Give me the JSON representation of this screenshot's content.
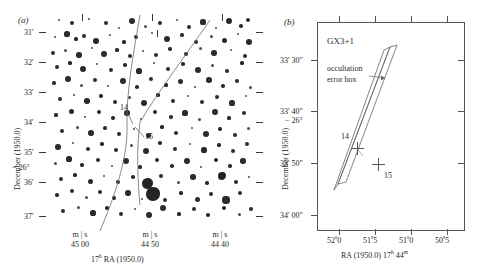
{
  "figure": {
    "kind": "two-panel astronomical finding chart",
    "panels": [
      {
        "letter": "(a)",
        "y_axis_title": "December (1950.0)",
        "y_tick_labels": [
          "31'",
          "32'",
          "33'",
          "34'",
          "35'",
          "36'",
          "37'"
        ],
        "y_degree_label": "− 26°",
        "x_axis_title_parts": {
          "hour": "17",
          "hour_sup": "h",
          "rest": " RA (1950.0)"
        },
        "x_groups": [
          {
            "units": "m | s",
            "value": "45  00"
          },
          {
            "units": "m | s",
            "value": "44  50"
          },
          {
            "units": "m | s",
            "value": "44  40"
          }
        ],
        "star_annotations": [
          {
            "id": "14",
            "label": "14"
          },
          {
            "id": "15",
            "label": "15"
          }
        ]
      },
      {
        "letter": "(b)",
        "title": "GX3+1",
        "annotation": {
          "line1": "occultation",
          "line2": "error box"
        },
        "y_axis_title": "December (1950.0)",
        "y_tick_labels": [
          "33' 30\"",
          "33' 40\"",
          "33' 50\"",
          "34' 00\""
        ],
        "y_degree_label": "− 26°",
        "x_tick_labels": [
          {
            "pre": "52",
            "sup": "s",
            "post": "0"
          },
          {
            "pre": "51",
            "sup": "s",
            "post": "5"
          },
          {
            "pre": "51",
            "sup": "s",
            "post": "0"
          },
          {
            "pre": "50",
            "sup": "s",
            "post": "5"
          }
        ],
        "x_axis_title_parts": {
          "lead": "RA (1950.0) 17",
          "sup1": "h",
          "mid": " 44",
          "sup2": "m"
        },
        "source_markers": [
          {
            "id": "14",
            "label": "14"
          },
          {
            "id": "15",
            "label": "15"
          }
        ]
      }
    ]
  },
  "colors": {
    "ink": "#2b2b2b",
    "frame": "#555555",
    "line": "#6b6b6b",
    "background": "#ffffff"
  },
  "chart_data": {
    "type": "scatter",
    "panel_a": {
      "xlabel": "17h RA (1950.0)",
      "ylabel": "December (1950.0)",
      "xtick_labels": [
        "45 00",
        "44 50",
        "44 40"
      ],
      "ytick_labels": [
        "31'",
        "32'",
        "33'",
        "34'",
        "35'",
        "36'",
        "37'"
      ],
      "grid": false,
      "stars": [
        {
          "x": 11,
          "y": 3,
          "r": 1.1
        },
        {
          "x": 24,
          "y": 6,
          "r": 1.9
        },
        {
          "x": 41,
          "y": 2,
          "r": 1.2
        },
        {
          "x": 58,
          "y": 6,
          "r": 2.1
        },
        {
          "x": 71,
          "y": 11,
          "r": 1.3
        },
        {
          "x": 84,
          "y": 4,
          "r": 2.9
        },
        {
          "x": 97,
          "y": 9,
          "r": 1.5
        },
        {
          "x": 112,
          "y": 6,
          "r": 2.4
        },
        {
          "x": 129,
          "y": 3,
          "r": 1.3
        },
        {
          "x": 141,
          "y": 10,
          "r": 1.9
        },
        {
          "x": 155,
          "y": 5,
          "r": 2.6
        },
        {
          "x": 168,
          "y": 11,
          "r": 1.4
        },
        {
          "x": 181,
          "y": 4,
          "r": 3.2
        },
        {
          "x": 193,
          "y": 9,
          "r": 1.8
        },
        {
          "x": 200,
          "y": 3,
          "r": 2.1
        },
        {
          "x": 7,
          "y": 20,
          "r": 1.4
        },
        {
          "x": 19,
          "y": 17,
          "r": 2.6
        },
        {
          "x": 28,
          "y": 22,
          "r": 1.6
        },
        {
          "x": 36,
          "y": 19,
          "r": 1.9
        },
        {
          "x": 48,
          "y": 24,
          "r": 2.8
        },
        {
          "x": 62,
          "y": 18,
          "r": 1.3
        },
        {
          "x": 76,
          "y": 25,
          "r": 1.6
        },
        {
          "x": 88,
          "y": 20,
          "r": 2.2
        },
        {
          "x": 104,
          "y": 16,
          "r": 1.4
        },
        {
          "x": 119,
          "y": 22,
          "r": 3.0
        },
        {
          "x": 134,
          "y": 18,
          "r": 1.7
        },
        {
          "x": 148,
          "y": 25,
          "r": 2.0
        },
        {
          "x": 163,
          "y": 19,
          "r": 1.5
        },
        {
          "x": 176,
          "y": 23,
          "r": 2.5
        },
        {
          "x": 190,
          "y": 17,
          "r": 1.4
        },
        {
          "x": 201,
          "y": 25,
          "r": 2.9
        },
        {
          "x": 5,
          "y": 36,
          "r": 2.0
        },
        {
          "x": 17,
          "y": 33,
          "r": 1.5
        },
        {
          "x": 31,
          "y": 38,
          "r": 2.7
        },
        {
          "x": 44,
          "y": 31,
          "r": 1.4
        },
        {
          "x": 56,
          "y": 37,
          "r": 3.3
        },
        {
          "x": 69,
          "y": 33,
          "r": 1.6
        },
        {
          "x": 82,
          "y": 39,
          "r": 2.1
        },
        {
          "x": 95,
          "y": 34,
          "r": 1.3
        },
        {
          "x": 108,
          "y": 38,
          "r": 2.4
        },
        {
          "x": 122,
          "y": 32,
          "r": 1.7
        },
        {
          "x": 138,
          "y": 37,
          "r": 2.0
        },
        {
          "x": 152,
          "y": 31,
          "r": 1.5
        },
        {
          "x": 166,
          "y": 36,
          "r": 2.8
        },
        {
          "x": 183,
          "y": 33,
          "r": 1.4
        },
        {
          "x": 197,
          "y": 39,
          "r": 2.2
        },
        {
          "x": 9,
          "y": 50,
          "r": 2.4
        },
        {
          "x": 22,
          "y": 46,
          "r": 1.6
        },
        {
          "x": 35,
          "y": 52,
          "r": 3.1
        },
        {
          "x": 49,
          "y": 47,
          "r": 1.4
        },
        {
          "x": 63,
          "y": 53,
          "r": 2.0
        },
        {
          "x": 77,
          "y": 48,
          "r": 1.7
        },
        {
          "x": 91,
          "y": 54,
          "r": 2.6
        },
        {
          "x": 106,
          "y": 46,
          "r": 1.3
        },
        {
          "x": 120,
          "y": 52,
          "r": 2.2
        },
        {
          "x": 135,
          "y": 47,
          "r": 1.8
        },
        {
          "x": 150,
          "y": 53,
          "r": 2.9
        },
        {
          "x": 164,
          "y": 48,
          "r": 1.5
        },
        {
          "x": 179,
          "y": 54,
          "r": 2.3
        },
        {
          "x": 194,
          "y": 46,
          "r": 1.6
        },
        {
          "x": 6,
          "y": 66,
          "r": 1.7
        },
        {
          "x": 20,
          "y": 62,
          "r": 2.9
        },
        {
          "x": 33,
          "y": 68,
          "r": 1.5
        },
        {
          "x": 47,
          "y": 63,
          "r": 2.2
        },
        {
          "x": 60,
          "y": 69,
          "r": 1.3
        },
        {
          "x": 75,
          "y": 64,
          "r": 3.4
        },
        {
          "x": 89,
          "y": 70,
          "r": 1.8
        },
        {
          "x": 103,
          "y": 62,
          "r": 2.1
        },
        {
          "x": 118,
          "y": 68,
          "r": 1.6
        },
        {
          "x": 132,
          "y": 64,
          "r": 2.5
        },
        {
          "x": 147,
          "y": 70,
          "r": 1.4
        },
        {
          "x": 161,
          "y": 63,
          "r": 2.8
        },
        {
          "x": 175,
          "y": 69,
          "r": 1.7
        },
        {
          "x": 189,
          "y": 64,
          "r": 2.0
        },
        {
          "x": 202,
          "y": 70,
          "r": 1.5
        },
        {
          "x": 12,
          "y": 82,
          "r": 2.3
        },
        {
          "x": 26,
          "y": 78,
          "r": 1.4
        },
        {
          "x": 39,
          "y": 84,
          "r": 2.7
        },
        {
          "x": 53,
          "y": 79,
          "r": 1.8
        },
        {
          "x": 67,
          "y": 85,
          "r": 2.1
        },
        {
          "x": 81,
          "y": 80,
          "r": 1.5
        },
        {
          "x": 96,
          "y": 86,
          "r": 3.0
        },
        {
          "x": 110,
          "y": 78,
          "r": 1.6
        },
        {
          "x": 125,
          "y": 84,
          "r": 2.4
        },
        {
          "x": 140,
          "y": 79,
          "r": 1.3
        },
        {
          "x": 154,
          "y": 85,
          "r": 2.2
        },
        {
          "x": 169,
          "y": 80,
          "r": 1.9
        },
        {
          "x": 184,
          "y": 86,
          "r": 2.6
        },
        {
          "x": 198,
          "y": 79,
          "r": 1.4
        },
        {
          "x": 8,
          "y": 98,
          "r": 1.6
        },
        {
          "x": 23,
          "y": 94,
          "r": 2.5
        },
        {
          "x": 37,
          "y": 100,
          "r": 1.4
        },
        {
          "x": 51,
          "y": 95,
          "r": 2.0
        },
        {
          "x": 65,
          "y": 101,
          "r": 1.7
        },
        {
          "x": 79,
          "y": 96,
          "r": 2.8
        },
        {
          "x": 93,
          "y": 102,
          "r": 1.3
        },
        {
          "x": 107,
          "y": 95,
          "r": 2.2
        },
        {
          "x": 123,
          "y": 100,
          "r": 1.8
        },
        {
          "x": 137,
          "y": 96,
          "r": 2.6
        },
        {
          "x": 151,
          "y": 102,
          "r": 1.5
        },
        {
          "x": 167,
          "y": 95,
          "r": 3.1
        },
        {
          "x": 181,
          "y": 101,
          "r": 1.6
        },
        {
          "x": 196,
          "y": 96,
          "r": 2.3
        },
        {
          "x": 14,
          "y": 114,
          "r": 2.1
        },
        {
          "x": 29,
          "y": 110,
          "r": 1.5
        },
        {
          "x": 43,
          "y": 116,
          "r": 2.7
        },
        {
          "x": 57,
          "y": 111,
          "r": 1.8
        },
        {
          "x": 71,
          "y": 117,
          "r": 2.0
        },
        {
          "x": 86,
          "y": 112,
          "r": 1.4
        },
        {
          "x": 100,
          "y": 118,
          "r": 2.5
        },
        {
          "x": 114,
          "y": 110,
          "r": 1.6
        },
        {
          "x": 128,
          "y": 116,
          "r": 2.2
        },
        {
          "x": 144,
          "y": 111,
          "r": 1.3
        },
        {
          "x": 158,
          "y": 117,
          "r": 2.9
        },
        {
          "x": 172,
          "y": 112,
          "r": 1.7
        },
        {
          "x": 187,
          "y": 118,
          "r": 2.1
        },
        {
          "x": 200,
          "y": 111,
          "r": 1.5
        },
        {
          "x": 10,
          "y": 130,
          "r": 2.8
        },
        {
          "x": 25,
          "y": 126,
          "r": 1.4
        },
        {
          "x": 40,
          "y": 132,
          "r": 2.0
        },
        {
          "x": 54,
          "y": 127,
          "r": 1.7
        },
        {
          "x": 68,
          "y": 133,
          "r": 2.4
        },
        {
          "x": 83,
          "y": 128,
          "r": 1.5
        },
        {
          "x": 98,
          "y": 134,
          "r": 3.2
        },
        {
          "x": 112,
          "y": 126,
          "r": 1.8
        },
        {
          "x": 127,
          "y": 132,
          "r": 2.1
        },
        {
          "x": 142,
          "y": 127,
          "r": 1.3
        },
        {
          "x": 156,
          "y": 133,
          "r": 2.6
        },
        {
          "x": 171,
          "y": 128,
          "r": 1.6
        },
        {
          "x": 185,
          "y": 134,
          "r": 2.3
        },
        {
          "x": 199,
          "y": 127,
          "r": 1.9
        },
        {
          "x": 7,
          "y": 146,
          "r": 1.5
        },
        {
          "x": 21,
          "y": 142,
          "r": 2.6
        },
        {
          "x": 34,
          "y": 148,
          "r": 1.7
        },
        {
          "x": 50,
          "y": 143,
          "r": 2.2
        },
        {
          "x": 64,
          "y": 149,
          "r": 1.4
        },
        {
          "x": 78,
          "y": 144,
          "r": 2.9
        },
        {
          "x": 92,
          "y": 150,
          "r": 1.6
        },
        {
          "x": 109,
          "y": 143,
          "r": 2.0
        },
        {
          "x": 124,
          "y": 149,
          "r": 1.8
        },
        {
          "x": 139,
          "y": 144,
          "r": 3.4
        },
        {
          "x": 153,
          "y": 150,
          "r": 1.3
        },
        {
          "x": 168,
          "y": 143,
          "r": 2.4
        },
        {
          "x": 182,
          "y": 149,
          "r": 1.7
        },
        {
          "x": 195,
          "y": 144,
          "r": 2.7
        },
        {
          "x": 13,
          "y": 162,
          "r": 2.2
        },
        {
          "x": 27,
          "y": 158,
          "r": 1.6
        },
        {
          "x": 42,
          "y": 164,
          "r": 2.5
        },
        {
          "x": 56,
          "y": 159,
          "r": 1.4
        },
        {
          "x": 70,
          "y": 165,
          "r": 2.0
        },
        {
          "x": 85,
          "y": 160,
          "r": 1.8
        },
        {
          "x": 99,
          "y": 166,
          "r": 5.5
        },
        {
          "x": 113,
          "y": 159,
          "r": 2.3
        },
        {
          "x": 130,
          "y": 165,
          "r": 1.5
        },
        {
          "x": 145,
          "y": 160,
          "r": 2.8
        },
        {
          "x": 159,
          "y": 166,
          "r": 1.7
        },
        {
          "x": 174,
          "y": 159,
          "r": 4.2
        },
        {
          "x": 188,
          "y": 165,
          "r": 2.1
        },
        {
          "x": 201,
          "y": 160,
          "r": 1.4
        },
        {
          "x": 9,
          "y": 178,
          "r": 1.7
        },
        {
          "x": 24,
          "y": 174,
          "r": 2.4
        },
        {
          "x": 38,
          "y": 180,
          "r": 1.5
        },
        {
          "x": 52,
          "y": 175,
          "r": 2.1
        },
        {
          "x": 66,
          "y": 181,
          "r": 1.8
        },
        {
          "x": 80,
          "y": 176,
          "r": 2.7
        },
        {
          "x": 94,
          "y": 182,
          "r": 1.3
        },
        {
          "x": 105,
          "y": 177,
          "r": 6.8
        },
        {
          "x": 117,
          "y": 183,
          "r": 2.2
        },
        {
          "x": 133,
          "y": 176,
          "r": 1.6
        },
        {
          "x": 149,
          "y": 182,
          "r": 2.5
        },
        {
          "x": 163,
          "y": 177,
          "r": 1.9
        },
        {
          "x": 178,
          "y": 183,
          "r": 3.6
        },
        {
          "x": 192,
          "y": 176,
          "r": 2.0
        },
        {
          "x": 15,
          "y": 194,
          "r": 2.3
        },
        {
          "x": 30,
          "y": 190,
          "r": 1.5
        },
        {
          "x": 45,
          "y": 196,
          "r": 2.6
        },
        {
          "x": 59,
          "y": 191,
          "r": 1.7
        },
        {
          "x": 73,
          "y": 197,
          "r": 2.0
        },
        {
          "x": 87,
          "y": 192,
          "r": 1.4
        },
        {
          "x": 101,
          "y": 198,
          "r": 2.9
        },
        {
          "x": 115,
          "y": 191,
          "r": 3.3
        },
        {
          "x": 131,
          "y": 197,
          "r": 1.6
        },
        {
          "x": 146,
          "y": 192,
          "r": 2.2
        },
        {
          "x": 160,
          "y": 198,
          "r": 1.8
        },
        {
          "x": 176,
          "y": 191,
          "r": 2.4
        },
        {
          "x": 191,
          "y": 197,
          "r": 1.5
        },
        {
          "x": 203,
          "y": 192,
          "r": 2.0
        }
      ],
      "error_box_curves": [
        "left-boundary arc (steep, crossing from top-centre down to bottom-left)",
        "right-boundary arc (crossing from top-right down through the marked star)"
      ]
    },
    "panel_b": {
      "xlabel": "RA (1950.0) 17h 44m",
      "ylabel": "December (1950.0)",
      "xtick_labels": [
        "52.0s",
        "51.5s",
        "51.0s",
        "50.5s"
      ],
      "ytick_labels": [
        "33' 30\"",
        "33' 40\"",
        "33' 50\"",
        "34' 00\""
      ],
      "xlim": [
        "52.2s",
        "50.3s"
      ],
      "ylim": [
        "-26 34' 05\"",
        "-26 33' 25\""
      ],
      "grid": false,
      "error_box_polygon": [
        {
          "x": "51.75s",
          "y": "33' 28\""
        },
        {
          "x": "51.62s",
          "y": "33' 28\""
        },
        {
          "x": "52.02s",
          "y": "34' 02\""
        },
        {
          "x": "52.08s",
          "y": "33' 59\""
        }
      ],
      "markers": [
        {
          "label": "14",
          "x": "51.93s",
          "y": "33' 49\""
        },
        {
          "label": "15",
          "x": "51.72s",
          "y": "33' 53\""
        }
      ]
    }
  }
}
